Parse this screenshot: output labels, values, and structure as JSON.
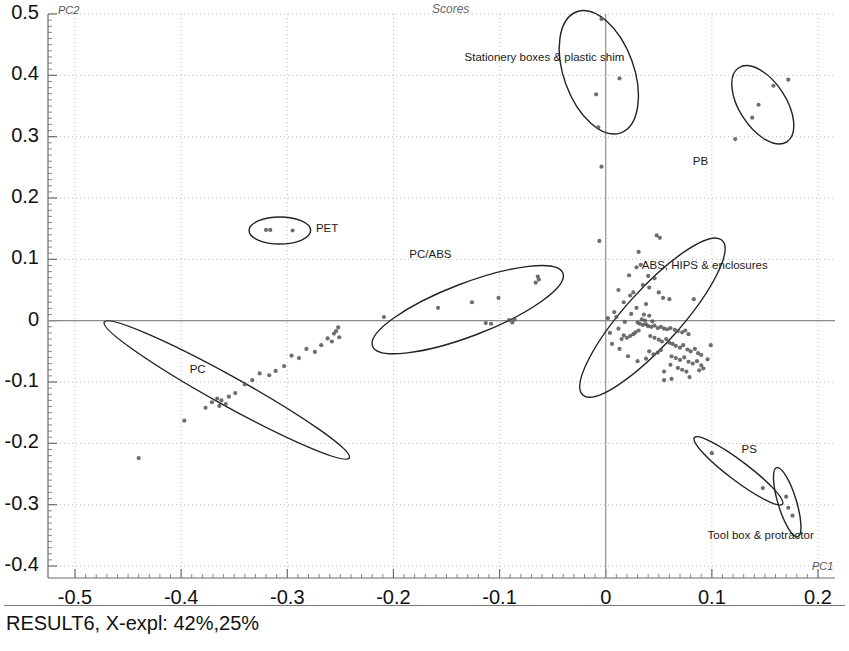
{
  "chart_data": {
    "type": "scatter",
    "title": "Scores",
    "xlabel": "PC1",
    "ylabel": "PC2",
    "footer": "RESULT6, X-expl: 42%,25%",
    "xlim": [
      -0.55,
      0.225
    ],
    "ylim": [
      -0.42,
      0.52
    ],
    "xticks": [
      -0.5,
      -0.4,
      -0.3,
      -0.2,
      -0.1,
      0,
      0.1,
      0.2
    ],
    "xtick_labels": [
      "-0.5",
      "-0.4",
      "-0.3",
      "-0.2",
      "-0.1",
      "0",
      "0.1",
      "0.2"
    ],
    "yticks": [
      0.5,
      0.4,
      0.3,
      0.2,
      0.1,
      0,
      -0.1,
      -0.2,
      -0.3,
      -0.4
    ],
    "ytick_labels": [
      "0.5",
      "0.4",
      "0.3",
      "0.2",
      "0.1",
      "0",
      "-0.1",
      "-0.2",
      "-0.3",
      "-0.4"
    ],
    "grid": "dotted",
    "legend": "none",
    "zero_lines": {
      "x": 0,
      "y": 0
    },
    "point_color": "#555555",
    "ellipse_color": "#222222",
    "annotations": [
      {
        "id": "stationery",
        "text": "Stationery boxes & plastic shim",
        "x": -0.133,
        "y": 0.427
      },
      {
        "id": "pb",
        "text": "PB",
        "x": 0.082,
        "y": 0.257
      },
      {
        "id": "pet",
        "text": "PET",
        "x": -0.273,
        "y": 0.148
      },
      {
        "id": "pcabs",
        "text": "PC/ABS",
        "x": -0.185,
        "y": 0.105
      },
      {
        "id": "abs",
        "text": "ABS, HIPS & enclosures",
        "x": 0.034,
        "y": 0.087
      },
      {
        "id": "pc",
        "text": "PC",
        "x": -0.392,
        "y": -0.082
      },
      {
        "id": "ps",
        "text": "PS",
        "x": 0.128,
        "y": -0.213
      },
      {
        "id": "toolbox",
        "text": "Tool box & protractor",
        "x": 0.096,
        "y": -0.352
      }
    ],
    "clusters": [
      {
        "name": "Stationery boxes & plastic shim",
        "ellipse": {
          "cx": -0.0065,
          "cy": 0.405,
          "rx": 0.033,
          "ry": 0.105,
          "rot": -20
        },
        "points": [
          [
            -0.004,
            0.492
          ],
          [
            0.013,
            0.395
          ],
          [
            -0.009,
            0.369
          ],
          [
            -0.007,
            0.315
          ],
          [
            -0.004,
            0.251
          ]
        ]
      },
      {
        "name": "PB",
        "ellipse": {
          "cx": 0.148,
          "cy": 0.352,
          "rx": 0.022,
          "ry": 0.072,
          "rot": -33
        },
        "points": [
          [
            0.172,
            0.393
          ],
          [
            0.158,
            0.383
          ],
          [
            0.144,
            0.352
          ],
          [
            0.138,
            0.331
          ],
          [
            0.122,
            0.296
          ]
        ]
      },
      {
        "name": "PET",
        "ellipse": {
          "cx": -0.307,
          "cy": 0.147,
          "rx": 0.029,
          "ry": 0.022,
          "rot": 0
        },
        "points": [
          [
            -0.32,
            0.148
          ],
          [
            -0.316,
            0.148
          ],
          [
            -0.295,
            0.147
          ]
        ]
      },
      {
        "name": "PC/ABS",
        "ellipse": {
          "cx": -0.13,
          "cy": 0.018,
          "rx": 0.096,
          "ry": 0.043,
          "rot": -21
        },
        "points": [
          [
            -0.064,
            0.072
          ],
          [
            -0.063,
            0.067
          ],
          [
            -0.066,
            0.062
          ],
          [
            -0.101,
            0.037
          ],
          [
            -0.126,
            0.03
          ],
          [
            -0.158,
            0.021
          ],
          [
            -0.209,
            0.006
          ],
          [
            -0.091,
            0.001
          ],
          [
            -0.086,
            0.002
          ],
          [
            -0.088,
            -0.003
          ],
          [
            -0.108,
            -0.005
          ],
          [
            -0.113,
            -0.004
          ]
        ]
      },
      {
        "name": "ABS, HIPS & enclosures",
        "ellipse": {
          "cx": 0.044,
          "cy": 0.005,
          "rx": 0.098,
          "ry": 0.045,
          "rot": -48
        },
        "points": [
          [
            0.048,
            0.139
          ],
          [
            0.051,
            0.135
          ],
          [
            -0.006,
            0.13
          ],
          [
            0.031,
            0.112
          ],
          [
            0.033,
            0.091
          ],
          [
            0.029,
            0.087
          ],
          [
            0.022,
            0.074
          ],
          [
            0.04,
            0.073
          ],
          [
            0.046,
            0.069
          ],
          [
            0.035,
            0.058
          ],
          [
            0.041,
            0.054
          ],
          [
            0.05,
            0.046
          ],
          [
            0.026,
            0.046
          ],
          [
            0.054,
            0.037
          ],
          [
            0.06,
            0.035
          ],
          [
            0.083,
            0.035
          ],
          [
            0.038,
            0.027
          ],
          [
            0.029,
            0.021
          ],
          [
            0.024,
            0.011
          ],
          [
            0.036,
            0.01
          ],
          [
            0.041,
            0.008
          ],
          [
            0.01,
            0.006
          ],
          [
            0.002,
            0.004
          ],
          [
            0.034,
            0.002
          ],
          [
            0.037,
            0.0
          ],
          [
            0.044,
            -0.001
          ],
          [
            0.03,
            -0.003
          ],
          [
            0.032,
            -0.005
          ],
          [
            0.035,
            -0.007
          ],
          [
            0.038,
            -0.006
          ],
          [
            0.04,
            -0.009
          ],
          [
            0.043,
            -0.01
          ],
          [
            0.046,
            -0.008
          ],
          [
            0.049,
            -0.012
          ],
          [
            0.052,
            -0.01
          ],
          [
            0.055,
            -0.013
          ],
          [
            0.058,
            -0.014
          ],
          [
            0.061,
            -0.012
          ],
          [
            0.065,
            -0.015
          ],
          [
            0.068,
            -0.017
          ],
          [
            0.072,
            -0.019
          ],
          [
            0.075,
            -0.016
          ],
          [
            0.078,
            -0.022
          ],
          [
            0.031,
            -0.016
          ],
          [
            0.028,
            -0.019
          ],
          [
            0.026,
            -0.022
          ],
          [
            0.023,
            -0.025
          ],
          [
            0.02,
            -0.028
          ],
          [
            0.017,
            -0.024
          ],
          [
            0.015,
            -0.03
          ],
          [
            0.042,
            -0.025
          ],
          [
            0.046,
            -0.028
          ],
          [
            0.05,
            -0.031
          ],
          [
            0.053,
            -0.034
          ],
          [
            0.057,
            -0.03
          ],
          [
            0.06,
            -0.036
          ],
          [
            0.063,
            -0.038
          ],
          [
            0.066,
            -0.041
          ],
          [
            0.07,
            -0.044
          ],
          [
            0.073,
            -0.04
          ],
          [
            0.077,
            -0.047
          ],
          [
            0.08,
            -0.05
          ],
          [
            0.084,
            -0.046
          ],
          [
            0.087,
            -0.053
          ],
          [
            0.09,
            -0.056
          ],
          [
            0.052,
            -0.048
          ],
          [
            0.049,
            -0.052
          ],
          [
            0.045,
            -0.055
          ],
          [
            0.041,
            -0.05
          ],
          [
            0.062,
            -0.058
          ],
          [
            0.066,
            -0.061
          ],
          [
            0.07,
            -0.064
          ],
          [
            0.074,
            -0.06
          ],
          [
            0.078,
            -0.067
          ],
          [
            0.082,
            -0.07
          ],
          [
            0.086,
            -0.066
          ],
          [
            0.09,
            -0.073
          ],
          [
            0.068,
            -0.077
          ],
          [
            0.072,
            -0.08
          ],
          [
            0.076,
            -0.083
          ],
          [
            0.061,
            -0.072
          ],
          [
            0.088,
            -0.081
          ],
          [
            0.092,
            -0.078
          ],
          [
            0.055,
            -0.083
          ],
          [
            0.038,
            -0.062
          ],
          [
            0.03,
            -0.066
          ],
          [
            0.021,
            -0.058
          ],
          [
            0.013,
            -0.046
          ],
          [
            0.006,
            -0.038
          ],
          [
            0.004,
            -0.02
          ],
          [
            0.012,
            -0.013
          ],
          [
            0.018,
            -0.002
          ],
          [
            0.008,
            0.014
          ],
          [
            0.017,
            0.03
          ],
          [
            0.023,
            0.041
          ],
          [
            0.012,
            0.05
          ],
          [
            0.055,
            -0.097
          ],
          [
            0.062,
            -0.095
          ],
          [
            0.079,
            -0.092
          ],
          [
            0.096,
            -0.063
          ],
          [
            0.099,
            -0.04
          ]
        ]
      },
      {
        "name": "PC",
        "ellipse": {
          "cx": -0.357,
          "cy": -0.113,
          "rx": 0.132,
          "ry": 0.024,
          "rot": 29
        },
        "points": [
          [
            -0.252,
            -0.011
          ],
          [
            -0.254,
            -0.017
          ],
          [
            -0.256,
            -0.021
          ],
          [
            -0.251,
            -0.027
          ],
          [
            -0.258,
            -0.034
          ],
          [
            -0.262,
            -0.029
          ],
          [
            -0.268,
            -0.04
          ],
          [
            -0.274,
            -0.051
          ],
          [
            -0.282,
            -0.046
          ],
          [
            -0.289,
            -0.061
          ],
          [
            -0.296,
            -0.057
          ],
          [
            -0.303,
            -0.074
          ],
          [
            -0.311,
            -0.082
          ],
          [
            -0.317,
            -0.089
          ],
          [
            -0.326,
            -0.086
          ],
          [
            -0.333,
            -0.097
          ],
          [
            -0.34,
            -0.104
          ],
          [
            -0.349,
            -0.118
          ],
          [
            -0.355,
            -0.124
          ],
          [
            -0.362,
            -0.13
          ],
          [
            -0.366,
            -0.127
          ],
          [
            -0.371,
            -0.133
          ],
          [
            -0.364,
            -0.139
          ],
          [
            -0.358,
            -0.136
          ],
          [
            -0.377,
            -0.142
          ],
          [
            -0.397,
            -0.163
          ],
          [
            -0.44,
            -0.224
          ]
        ]
      },
      {
        "name": "PS",
        "ellipse": {
          "cx": 0.125,
          "cy": -0.245,
          "rx": 0.052,
          "ry": 0.016,
          "rot": 37
        },
        "points": [
          [
            0.1,
            -0.216
          ],
          [
            0.148,
            -0.273
          ]
        ]
      },
      {
        "name": "Tool box & protractor",
        "ellipse": {
          "cx": 0.171,
          "cy": -0.296,
          "rx": 0.034,
          "ry": 0.015,
          "rot": 73
        },
        "points": [
          [
            0.17,
            -0.287
          ],
          [
            0.172,
            -0.305
          ],
          [
            0.176,
            -0.318
          ]
        ]
      }
    ]
  },
  "axes": {
    "y_name": "PC2",
    "x_name": "PC1"
  }
}
